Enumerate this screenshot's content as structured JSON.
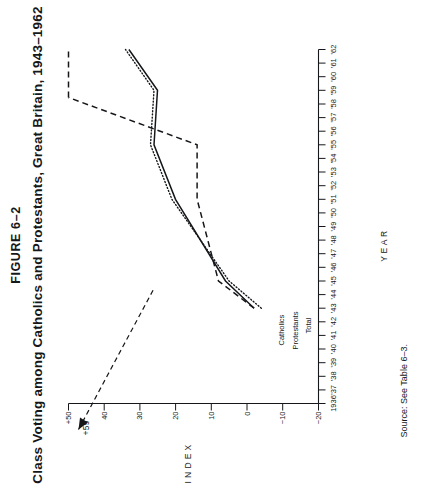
{
  "figure": {
    "number": "FIGURE 6–2",
    "title": "Class Voting among Catholics and Protestants, Great Britain, 1943–1962",
    "source": "Source: See Table 6–3."
  },
  "annotations": [
    {
      "name": "peak-callout",
      "text": "+59"
    }
  ],
  "series_labels": {
    "catholics": "Catholics",
    "protestants": "Protestants",
    "total": "Total"
  },
  "chart_data": {
    "type": "line",
    "title": "Class Voting among Catholics and Protestants, Great Britain, 1943–1962",
    "xlabel": "YEAR",
    "ylabel": "INDEX",
    "xlim": [
      1936,
      1962
    ],
    "ylim": [
      -20,
      50
    ],
    "grid": false,
    "legend": "inline-at-line-ends",
    "x_tick_labels": [
      "1936",
      "'37",
      "'38",
      "'39",
      "'40",
      "'41",
      "'42",
      "'43",
      "'44",
      "'45",
      "'46",
      "'47",
      "'48",
      "'49",
      "'50",
      "'51",
      "'52",
      "'53",
      "'54",
      "'55",
      "'56",
      "'57",
      "'58",
      "'59",
      "'60",
      "'61",
      "'62"
    ],
    "x_tick_values": [
      1936,
      1937,
      1938,
      1939,
      1940,
      1941,
      1942,
      1943,
      1944,
      1945,
      1946,
      1947,
      1948,
      1949,
      1950,
      1951,
      1952,
      1953,
      1954,
      1955,
      1956,
      1957,
      1958,
      1959,
      1960,
      1961,
      1962
    ],
    "y_tick_labels": [
      "+50",
      "40",
      "30",
      "20",
      "10",
      "0",
      "−10",
      "−20"
    ],
    "y_tick_values": [
      50,
      40,
      30,
      20,
      10,
      0,
      -10,
      -20
    ],
    "annotations": [
      {
        "text": "+59",
        "series": "Catholics",
        "x": 1959,
        "y": 59,
        "note": "off-scale peak marked with arrow"
      }
    ],
    "series": [
      {
        "name": "Catholics",
        "style": "dashed",
        "x": [
          1943,
          1945,
          1951,
          1955,
          1959,
          1962
        ],
        "values": [
          12,
          22,
          28,
          28,
          59,
          36
        ]
      },
      {
        "name": "Protestants",
        "style": "dotted",
        "x": [
          1943,
          1945,
          1951,
          1955,
          1959,
          1962
        ],
        "values": [
          10,
          19,
          35,
          41,
          40,
          48
        ]
      },
      {
        "name": "Total",
        "style": "solid",
        "x": [
          1943,
          1945,
          1951,
          1955,
          1959,
          1962
        ],
        "values": [
          12,
          20,
          34,
          40,
          39,
          47
        ]
      }
    ]
  },
  "colors": {
    "ink": "#15171a",
    "paper": "#ffffff"
  }
}
